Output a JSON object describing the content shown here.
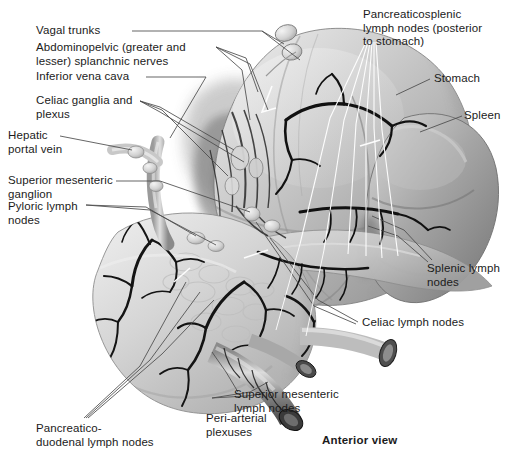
{
  "figure": {
    "title_caption": "Anterior view",
    "view_note": "Anterior view",
    "background_color": "#ffffff",
    "ink_color": "#1b1b1b",
    "leader_line_color": "#4a4a4a",
    "white_leader_color": "#ffffff"
  },
  "labels": {
    "vagal_trunks": "Vagal trunks",
    "splanchnic_nerves": "Abdominopelvic (greater and\nlesser) splanchnic nerves",
    "inferior_vena_cava": "Inferior vena cava",
    "celiac_ganglia": "Celiac ganglia and\nplexus",
    "hepatic_portal_vein": "Hepatic\nportal vein",
    "superior_mesenteric_ganglion": "Superior mesenteric\nganglion",
    "pyloric_lymph_nodes": "Pyloric lymph\nnodes",
    "pancreaticosplenic_lymph_nodes": "Pancreaticosplenic\nlymph nodes (posterior\nto stomach)",
    "stomach": "Stomach",
    "spleen": "Spleen",
    "splenic_lymph_nodes": "Splenic lymph\nnodes",
    "celiac_lymph_nodes": "Celiac lymph nodes",
    "superior_mesenteric_lymph_nodes": "Superior mesenteric\nlymph nodes",
    "peri_arterial_plexuses": "Peri-arterial\nplexuses",
    "pancreaticoduodenal_lymph_nodes": "Pancreatico-\nduodenal lymph nodes",
    "anterior_view": "Anterior view"
  },
  "structures": [
    {
      "name": "stomach",
      "tone": "#b9b9b9"
    },
    {
      "name": "spleen",
      "tone": "#9b9b9b"
    },
    {
      "name": "pancreas",
      "tone": "#c2c2c2"
    },
    {
      "name": "duodenum",
      "tone": "#cccccc"
    },
    {
      "name": "celiac-trunk-vessels",
      "tone": "#1a1a1a"
    },
    {
      "name": "superior-mesenteric-artery",
      "tone": "#8d8d8d"
    },
    {
      "name": "lymph-nodes",
      "tone": "#d8d8d8"
    }
  ]
}
